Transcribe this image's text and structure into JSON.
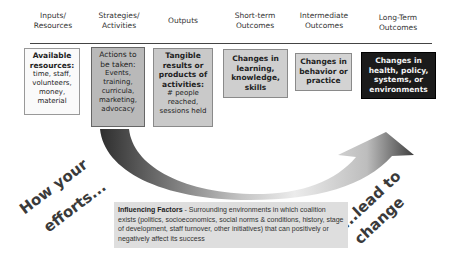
{
  "headers": [
    {
      "line1": "Inputs/",
      "line2": "Resources"
    },
    {
      "line1": "Strategies/",
      "line2": "Activities"
    },
    {
      "line1": "Outputs",
      "line2": ""
    },
    {
      "line1": "Short-term",
      "line2": "Outcomes"
    },
    {
      "line1": "Intermediate",
      "line2": "Outcomes"
    },
    {
      "line1": "Long-Term",
      "line2": "Outcomes"
    }
  ],
  "boxes": [
    {
      "bold": "Available resources:",
      "text": "time, staff, volunteers, money, material"
    },
    {
      "bold": "Actions to be taken:",
      "text": "Events, training, curricula, marketing, advocacy"
    },
    {
      "bold": "Tangible results or products of activities:",
      "text": "# people reached, sessions held"
    },
    {
      "bold": "Changes in learning, knowledge, skills",
      "text": ""
    },
    {
      "bold": "Changes in behavior or practice",
      "text": ""
    },
    {
      "bold": "Changes in health, policy, systems, or environments",
      "text": ""
    }
  ],
  "arrow_labels": {
    "left_line1": "How your",
    "left_line2": "efforts...",
    "right_line1": "...lead to",
    "right_line2": "change"
  },
  "influencing": {
    "title": "Influencing Factors",
    "text": " - Surrounding environments in which coalition exists (politics, socioeconomics, social norms & conditions, history, stage of development, staff turnover, other initiatives) that can positively or negatively affect its success"
  },
  "colors": {
    "box_light": "#fafafa",
    "box_dark_gray": "#b9b9b9",
    "box_mid_gray": "#c9c9c9",
    "box_long_term": "#1b1b1b",
    "influence_bg": "#dedede"
  }
}
